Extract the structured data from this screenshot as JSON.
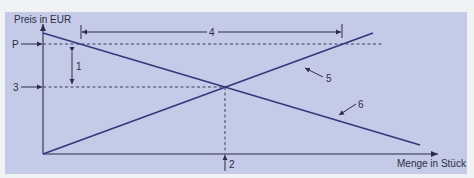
{
  "diagram": {
    "type": "supply-demand",
    "colors": {
      "panel_background": "#c4cae8",
      "curve": "#2f3a7a",
      "axis": "#2b2f45",
      "dashed": "#3a3f5c"
    },
    "axes": {
      "y_label": "Preis in EUR",
      "x_label": "Menge in Stück"
    },
    "markers": {
      "price_label": "P",
      "equilibrium_price_label": "3",
      "equilibrium_quantity_label": "2",
      "price_gap_label": "1",
      "quantity_gap_label": "4",
      "supply_curve_label": "5",
      "demand_curve_label": "6"
    },
    "curves": [
      {
        "name": "supply",
        "label": "5",
        "from": [
          43,
          154
        ],
        "to": [
          373,
          33
        ]
      },
      {
        "name": "demand",
        "label": "6",
        "from": [
          43,
          33
        ],
        "to": [
          420,
          145
        ]
      }
    ],
    "equilibrium": {
      "x": 225,
      "y": 87
    }
  }
}
